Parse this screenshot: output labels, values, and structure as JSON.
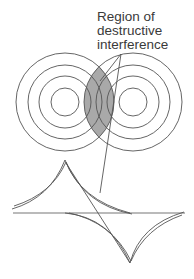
{
  "figure": {
    "annotation": {
      "lines": [
        "Region of",
        "destructive",
        "interference"
      ]
    },
    "colors": {
      "stroke": "#555555",
      "shade": "#a9a9a9",
      "background": "#ffffff",
      "text": "#3a3a3a"
    },
    "sources": [
      {
        "name": "left-source",
        "cx": 65,
        "cy": 102,
        "radii": [
          14,
          26,
          37,
          49
        ]
      },
      {
        "name": "right-source",
        "cx": 133,
        "cy": 102,
        "radii": [
          14,
          26,
          37,
          49
        ]
      }
    ],
    "waveform": {
      "baseline_y": 213,
      "peak": {
        "x": 65,
        "y": 160
      },
      "trough": {
        "x": 130,
        "y": 263
      }
    }
  }
}
